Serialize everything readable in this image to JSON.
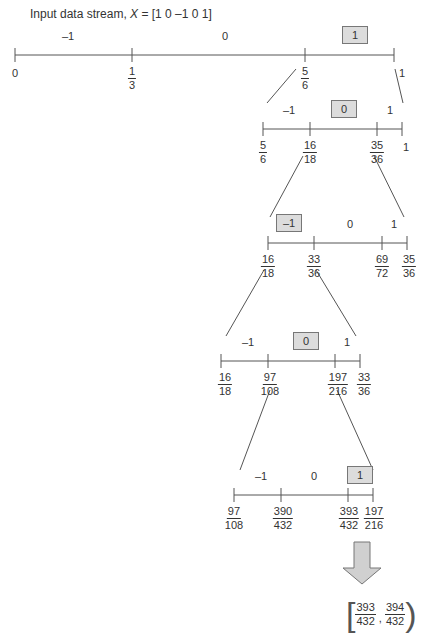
{
  "title": {
    "prefix": "Input data stream, ",
    "var": "X",
    "suffix": " = [1 0 –1 0 1]"
  },
  "levels": [
    {
      "y": 55,
      "ticks": [
        15,
        132,
        305,
        394
      ],
      "labels": [
        {
          "x": 15,
          "text": "0"
        },
        {
          "x": 132,
          "num": "1",
          "den": "3"
        },
        {
          "x": 305,
          "num": "5",
          "den": "6"
        },
        {
          "x": 402,
          "text": "1"
        }
      ],
      "symbols": [
        {
          "x": 68,
          "text": "–1",
          "selected": false
        },
        {
          "x": 225,
          "text": "0",
          "selected": false
        },
        {
          "x": 355,
          "text": "1",
          "selected": true
        }
      ]
    },
    {
      "y": 129,
      "ticks": [
        263,
        310,
        377,
        402
      ],
      "labels": [
        {
          "x": 263,
          "num": "5",
          "den": "6"
        },
        {
          "x": 310,
          "num": "16",
          "den": "18"
        },
        {
          "x": 377,
          "num": "35",
          "den": "36"
        },
        {
          "x": 406,
          "text": "1"
        }
      ],
      "symbols": [
        {
          "x": 289,
          "text": "–1",
          "selected": false
        },
        {
          "x": 344,
          "text": "0",
          "selected": true
        },
        {
          "x": 390,
          "text": "1",
          "selected": false
        }
      ]
    },
    {
      "y": 243,
      "ticks": [
        268,
        314,
        382,
        407
      ],
      "labels": [
        {
          "x": 268,
          "num": "16",
          "den": "18"
        },
        {
          "x": 314,
          "num": "33",
          "den": "36"
        },
        {
          "x": 382,
          "num": "69",
          "den": "72"
        },
        {
          "x": 409,
          "num": "35",
          "den": "36"
        }
      ],
      "symbols": [
        {
          "x": 289,
          "text": "–1",
          "selected": true
        },
        {
          "x": 350,
          "text": "0",
          "selected": false
        },
        {
          "x": 394,
          "text": "1",
          "selected": false
        }
      ]
    },
    {
      "y": 361,
      "ticks": [
        221,
        268,
        335,
        360
      ],
      "labels": [
        {
          "x": 225,
          "num": "16",
          "den": "18"
        },
        {
          "x": 270,
          "num": "97",
          "den": "108"
        },
        {
          "x": 338,
          "num": "197",
          "den": "216"
        },
        {
          "x": 364,
          "num": "33",
          "den": "36"
        }
      ],
      "symbols": [
        {
          "x": 248,
          "text": "–1",
          "selected": false
        },
        {
          "x": 306,
          "text": "0",
          "selected": true
        },
        {
          "x": 347,
          "text": "1",
          "selected": false
        }
      ]
    },
    {
      "y": 495,
      "ticks": [
        234,
        281,
        348,
        373
      ],
      "labels": [
        {
          "x": 234,
          "num": "97",
          "den": "108"
        },
        {
          "x": 283,
          "num": "390",
          "den": "432"
        },
        {
          "x": 349,
          "num": "393",
          "den": "432"
        },
        {
          "x": 374,
          "num": "197",
          "den": "216"
        }
      ],
      "symbols": [
        {
          "x": 261,
          "text": "–1",
          "selected": false
        },
        {
          "x": 314,
          "text": "0",
          "selected": false
        },
        {
          "x": 360,
          "text": "1",
          "selected": true
        }
      ]
    }
  ],
  "connectors": [
    [
      [
        296,
        69
      ],
      [
        267,
        103
      ]
    ],
    [
      [
        395,
        69
      ],
      [
        403,
        103
      ]
    ],
    [
      [
        303,
        156
      ],
      [
        270,
        217
      ]
    ],
    [
      [
        374,
        156
      ],
      [
        404,
        217
      ]
    ],
    [
      [
        264,
        270
      ],
      [
        226,
        336
      ]
    ],
    [
      [
        316,
        270
      ],
      [
        356,
        336
      ]
    ],
    [
      [
        270,
        390
      ],
      [
        240,
        470
      ]
    ],
    [
      [
        337,
        390
      ],
      [
        373,
        470
      ]
    ]
  ],
  "result": {
    "num1": "393",
    "den1": "432",
    "num2": "394",
    "den2": "432"
  },
  "colors": {
    "line": "#555555",
    "box_fill": "#dcdcdc",
    "arrow_fill": "#d0d0d0"
  }
}
